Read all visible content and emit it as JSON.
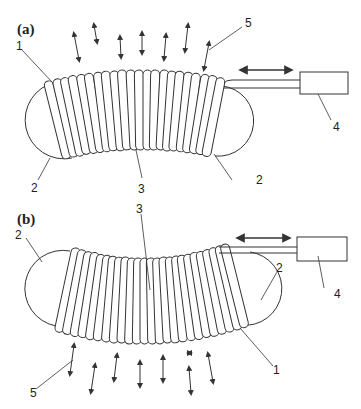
{
  "figure": {
    "panels": [
      {
        "id": "a",
        "label": "(a)",
        "callouts": {
          "c1": "1",
          "c2l": "2",
          "c2r": "2",
          "c3": "3",
          "c4": "4",
          "c5": "5"
        },
        "coil_turns": 25,
        "curvature": "arched-up"
      },
      {
        "id": "b",
        "label": "(b)",
        "callouts": {
          "c1": "1",
          "c2l": "2",
          "c2r": "2",
          "c3": "3",
          "c4": "4",
          "c5": "5"
        },
        "coil_turns": 25,
        "curvature": "sagging-down"
      }
    ],
    "legend_components": {
      "1": "coil end turn",
      "2": "end cap (hemispherical)",
      "3": "coil body",
      "4": "actuator box",
      "5": "vibration / motion arrows"
    },
    "colors": {
      "line": "#333333",
      "background": "#ffffff"
    }
  }
}
